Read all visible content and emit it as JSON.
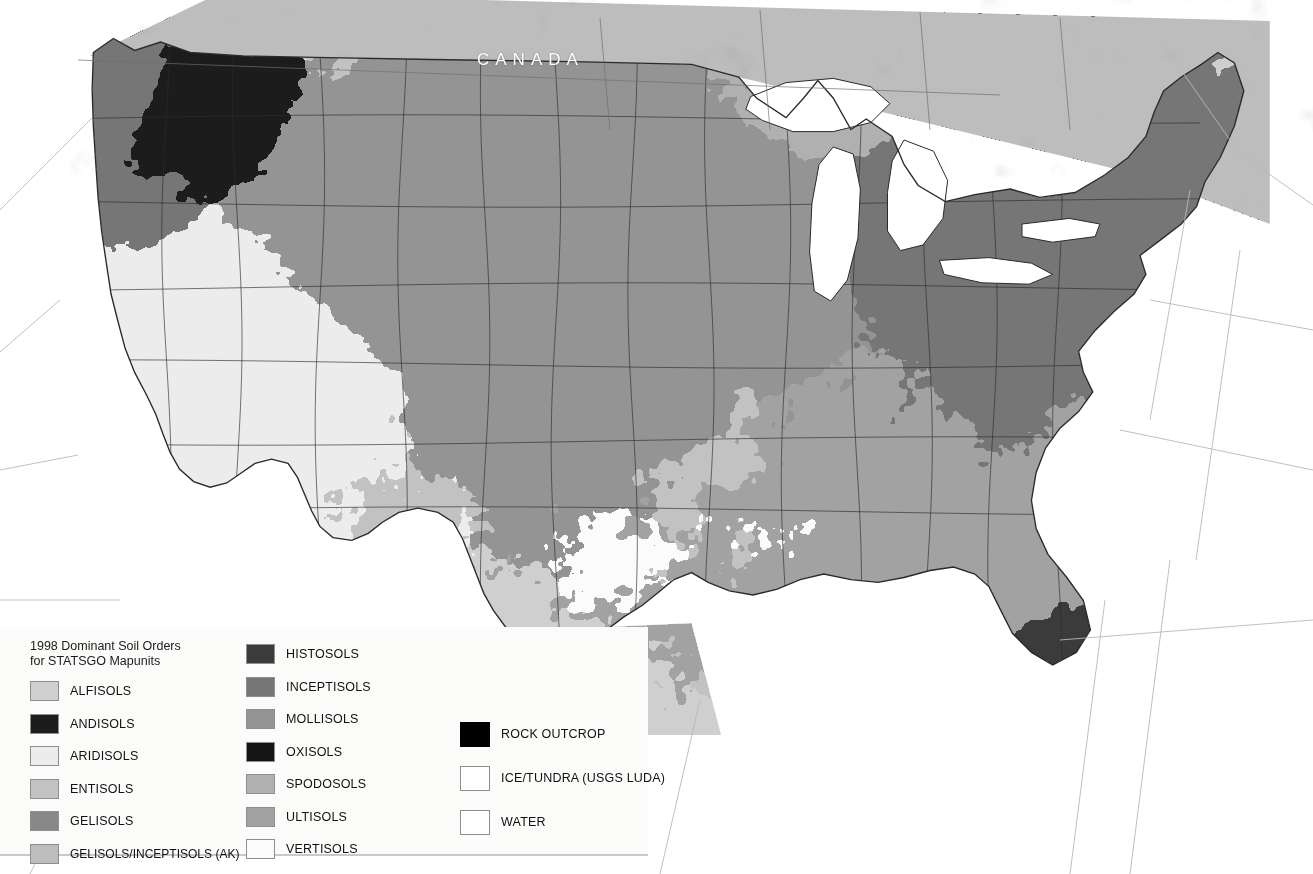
{
  "map": {
    "title_block": {
      "line1": "1998 Dominant Soil Orders",
      "line2": "for STATSGO Mapunits"
    },
    "country_labels": [
      {
        "name": "canada",
        "text": "CANADA"
      },
      {
        "name": "mexico",
        "text": "MEXICO"
      }
    ],
    "background_color": "#ffffff",
    "ocean_color": "#ffffff",
    "border_color": "#2a2a2a",
    "graticule_color": "#b9b9b9",
    "projection_note": "Conterminous United States, Albers-style conic"
  },
  "legend": {
    "background_color": "#fbfbfa",
    "columns": [
      {
        "id": "col-a",
        "items": [
          {
            "label": "ALFISOLS",
            "color": "#cfcfcf"
          },
          {
            "label": "ANDISOLS",
            "color": "#1c1c1c"
          },
          {
            "label": "ARIDISOLS",
            "color": "#ececec"
          },
          {
            "label": "ENTISOLS",
            "color": "#c2c2c2"
          },
          {
            "label": "GELISOLS",
            "color": "#888888"
          },
          {
            "label": "GELISOLS/INCEPTISOLS (AK)",
            "color": "#bdbdbd"
          }
        ]
      },
      {
        "id": "col-b",
        "items": [
          {
            "label": "HISTOSOLS",
            "color": "#3b3b3b"
          },
          {
            "label": "INCEPTISOLS",
            "color": "#767676"
          },
          {
            "label": "MOLLISOLS",
            "color": "#949494"
          },
          {
            "label": "OXISOLS",
            "color": "#141414"
          },
          {
            "label": "SPODOSOLS",
            "color": "#b0b0b0"
          },
          {
            "label": "ULTISOLS",
            "color": "#a2a2a2"
          },
          {
            "label": "VERTISOLS",
            "color": "#fbfbfb"
          }
        ]
      },
      {
        "id": "col-c",
        "items": [
          {
            "label": "ROCK OUTCROP",
            "color": "#000000"
          },
          {
            "label": "ICE/TUNDRA (USGS LUDA)",
            "color": "#ffffff"
          },
          {
            "label": "WATER",
            "color": "#ffffff"
          }
        ]
      }
    ]
  },
  "chart_data": {
    "type": "map",
    "title": "1998 Dominant Soil Orders for STATSGO Mapunits",
    "region": "Conterminous United States",
    "classes": [
      {
        "name": "ALFISOLS",
        "gray": "#cfcfcf"
      },
      {
        "name": "ANDISOLS",
        "gray": "#1c1c1c"
      },
      {
        "name": "ARIDISOLS",
        "gray": "#ececec"
      },
      {
        "name": "ENTISOLS",
        "gray": "#c2c2c2"
      },
      {
        "name": "GELISOLS",
        "gray": "#888888"
      },
      {
        "name": "GELISOLS/INCEPTISOLS (AK)",
        "gray": "#bdbdbd"
      },
      {
        "name": "HISTOSOLS",
        "gray": "#3b3b3b"
      },
      {
        "name": "INCEPTISOLS",
        "gray": "#767676"
      },
      {
        "name": "MOLLISOLS",
        "gray": "#949494"
      },
      {
        "name": "OXISOLS",
        "gray": "#141414"
      },
      {
        "name": "SPODOSOLS",
        "gray": "#b0b0b0"
      },
      {
        "name": "ULTISOLS",
        "gray": "#a2a2a2"
      },
      {
        "name": "VERTISOLS",
        "gray": "#fbfbfb"
      },
      {
        "name": "ROCK OUTCROP",
        "gray": "#000000"
      },
      {
        "name": "ICE/TUNDRA (USGS LUDA)",
        "gray": "#ffffff"
      },
      {
        "name": "WATER",
        "gray": "#ffffff"
      }
    ]
  }
}
